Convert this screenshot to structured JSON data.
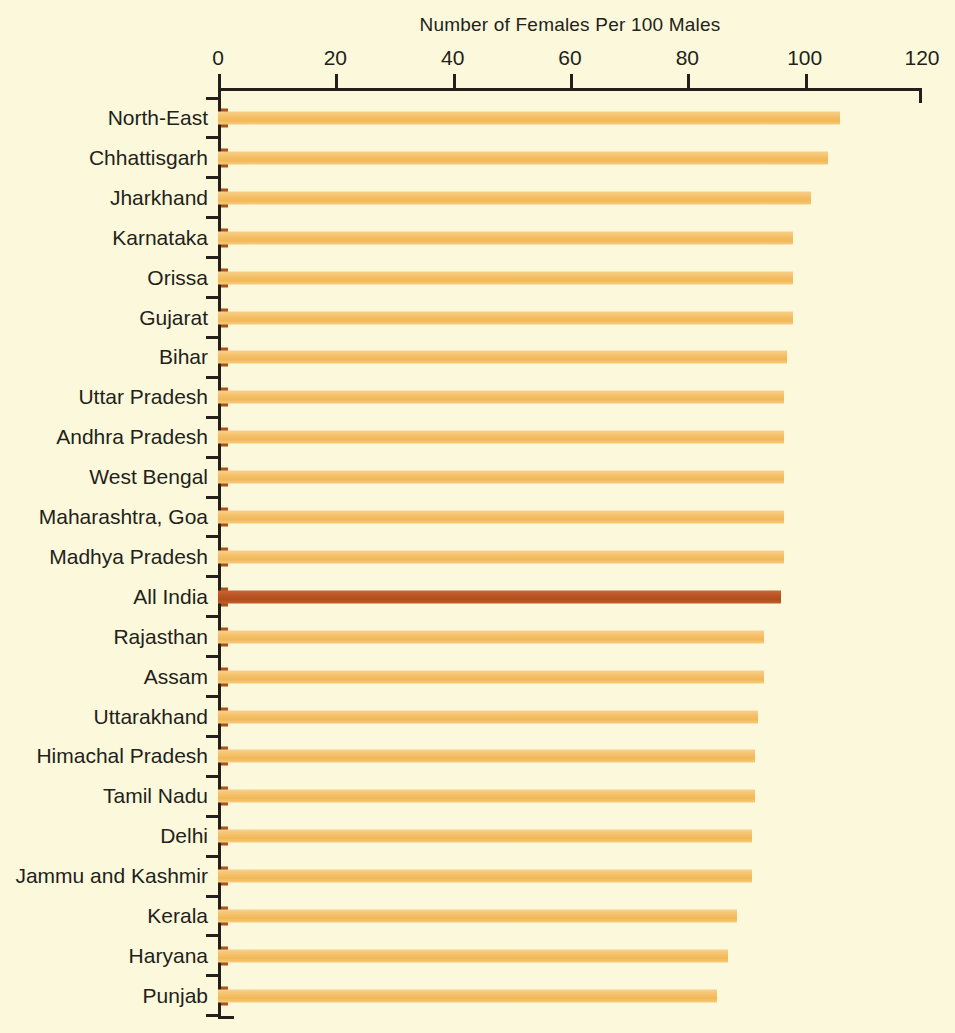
{
  "chart_data": {
    "type": "bar",
    "orientation": "horizontal",
    "title": "Number of Females Per 100 Males",
    "xlabel": "",
    "ylabel": "",
    "xlim": [
      0,
      120
    ],
    "xticks": [
      0,
      20,
      40,
      60,
      80,
      100,
      120
    ],
    "grid": false,
    "legend": false,
    "highlight_category": "All India",
    "colors": {
      "background": "#FBF8DC",
      "bar": "#F4BE66",
      "bar_highlight": "#B9521F",
      "bar_cap": "#A9521F",
      "axis": "#231F1A",
      "text": "#231F1A"
    },
    "categories": [
      "North-East",
      "Chhattisgarh",
      "Jharkhand",
      "Karnataka",
      "Orissa",
      "Gujarat",
      "Bihar",
      "Uttar Pradesh",
      "Andhra Pradesh",
      "West Bengal",
      "Maharashtra, Goa",
      "Madhya Pradesh",
      "All India",
      "Rajasthan",
      "Assam",
      "Uttarakhand",
      "Himachal Pradesh",
      "Tamil Nadu",
      "Delhi",
      "Jammu and Kashmir",
      "Kerala",
      "Haryana",
      "Punjab"
    ],
    "values": [
      106,
      104,
      101,
      98,
      98,
      98,
      97,
      96.5,
      96.5,
      96.5,
      96.5,
      96.5,
      96,
      93,
      93,
      92,
      91.5,
      91.5,
      91,
      91,
      88.5,
      87,
      85
    ]
  }
}
